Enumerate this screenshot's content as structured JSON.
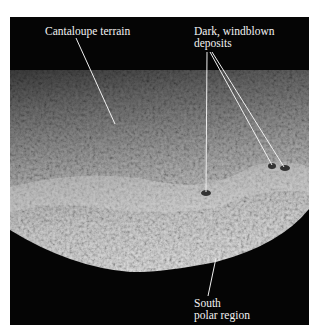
{
  "figure": {
    "colors": {
      "background": "#ffffff",
      "space": "#050505",
      "leader_line": "#f0f0f0",
      "label_text": "#f2f2f2"
    },
    "labels": [
      {
        "id": "cantaloupe",
        "lines": [
          "Cantaloupe terrain"
        ]
      },
      {
        "id": "dark-deposits",
        "lines": [
          "Dark, windblown",
          "deposits"
        ]
      },
      {
        "id": "south-polar",
        "lines": [
          "South",
          "polar region"
        ]
      }
    ]
  }
}
